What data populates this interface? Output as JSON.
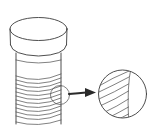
{
  "diagram": {
    "title": "Screw thread magnified detail",
    "parts": {
      "head": {
        "label": "bolt head",
        "shape": "cylinder"
      },
      "shank": {
        "label": "bolt shank",
        "shape": "cylinder"
      },
      "thread": {
        "label": "threaded section",
        "thread_lines": 10
      },
      "callout_circle": {
        "label": "detail callout circle"
      },
      "arrow": {
        "label": "magnification arrow",
        "direction": "right"
      },
      "detail_view": {
        "label": "magnified thread detail",
        "thread_lines": 6
      }
    },
    "colors": {
      "line": "#3a3a3a",
      "arrow": "#2a2a2a",
      "background": "#ffffff"
    }
  }
}
